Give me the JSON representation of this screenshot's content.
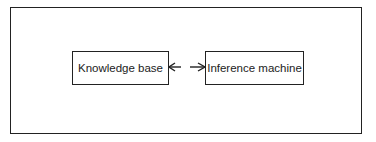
{
  "diagram": {
    "nodes": [
      {
        "id": "kb",
        "label": "Knowledge base"
      },
      {
        "id": "im",
        "label": "Inference machine"
      }
    ],
    "edges": [
      {
        "from": "im",
        "to": "kb",
        "style": "arrow"
      },
      {
        "from": "kb",
        "to": "im",
        "style": "arrow"
      }
    ]
  }
}
